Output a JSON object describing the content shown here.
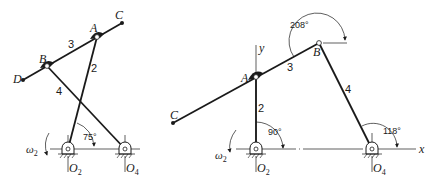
{
  "figure": {
    "left_mechanism": {
      "points": {
        "A": {
          "label": "A",
          "x": 97,
          "y": 37
        },
        "B": {
          "label": "B",
          "x": 47,
          "y": 66
        },
        "C": {
          "label": "C",
          "x": 122,
          "y": 23
        },
        "D": {
          "label": "D",
          "x": 23,
          "y": 80
        },
        "O2": {
          "label": "O",
          "sub": "2",
          "x": 68,
          "y": 149
        },
        "O4": {
          "label": "O",
          "sub": "4",
          "x": 125,
          "y": 149
        }
      },
      "links": {
        "link2": "2",
        "link3": "3",
        "link4": "4"
      },
      "angle": "75°",
      "omega": {
        "symbol": "ω",
        "sub": "2"
      }
    },
    "right_mechanism": {
      "points": {
        "A": {
          "label": "A",
          "x": 256,
          "y": 77
        },
        "B": {
          "label": "B",
          "x": 319,
          "y": 43
        },
        "C": {
          "label": "C",
          "x": 173,
          "y": 123
        },
        "O2": {
          "label": "O",
          "sub": "2",
          "x": 256,
          "y": 149
        },
        "O4": {
          "label": "O",
          "sub": "4",
          "x": 372,
          "y": 149
        }
      },
      "links": {
        "link2": "2",
        "link3": "3",
        "link4": "4"
      },
      "angles": {
        "theta2": "90°",
        "theta3": "208°",
        "theta4": "118°"
      },
      "axes": {
        "x": "x",
        "y": "y"
      },
      "omega": {
        "symbol": "ω",
        "sub": "2"
      }
    }
  }
}
